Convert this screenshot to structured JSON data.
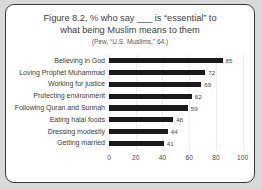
{
  "chart_data": {
    "type": "bar",
    "orientation": "horizontal",
    "title_line1": "Figure 8.2, % who say ___ is “essential” to",
    "title_line2": "what being Muslim means to them",
    "subtitle": "(Pew, “U.S. Muslims,” 64.)",
    "categories": [
      "Believing in God",
      "Loving Prophet Muhammad",
      "Working for justice",
      "Protecting environment",
      "Following Quran and Sunnah",
      "Eating halal foods",
      "Dressing modestly",
      "Getting married"
    ],
    "values": [
      85,
      72,
      69,
      62,
      59,
      48,
      44,
      41
    ],
    "xlabel": "",
    "ylabel": "",
    "xlim": [
      0,
      110
    ],
    "xticks": [
      0,
      20,
      40,
      60,
      80,
      100
    ],
    "grid": true,
    "legend": false,
    "bar_color": "#1a1a1a",
    "background_color": "#ffffff",
    "frame_color": "#3a3a3a",
    "page_background": "#d9d9d9"
  }
}
